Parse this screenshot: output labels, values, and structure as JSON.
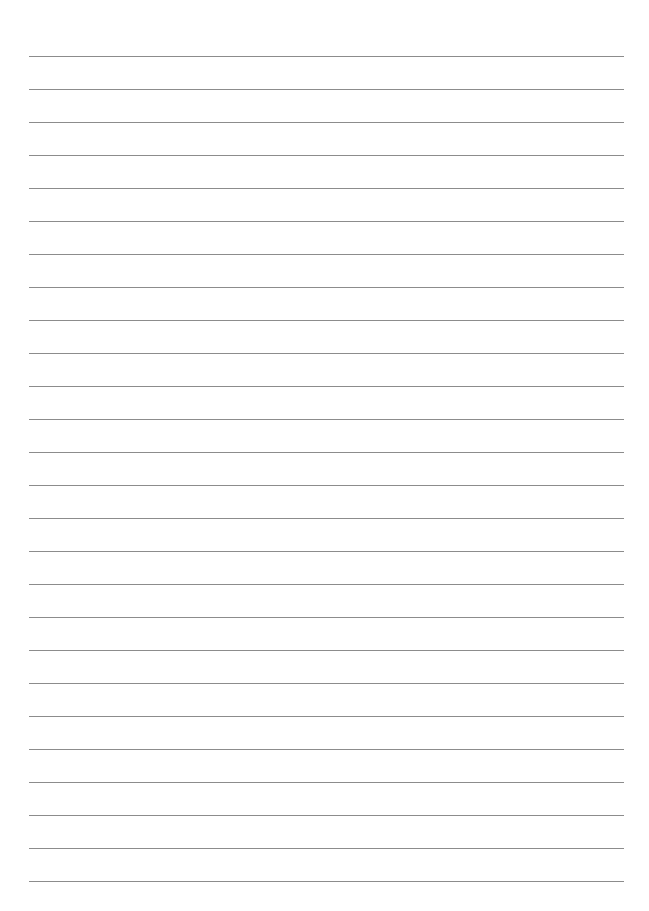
{
  "page": {
    "type": "lined-paper",
    "background": "#ffffff",
    "line_color": "#8c8c8c",
    "line_count": 26,
    "first_line_y": 56,
    "line_spacing": 33,
    "line_left": 29,
    "line_width": 595,
    "text_lines": [
      "",
      "",
      "",
      "",
      "",
      "",
      "",
      "",
      "",
      "",
      "",
      "",
      "",
      "",
      "",
      "",
      "",
      "",
      "",
      "",
      "",
      "",
      "",
      "",
      "",
      ""
    ]
  }
}
